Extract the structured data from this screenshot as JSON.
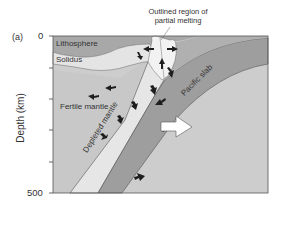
{
  "panel_label": "(a)",
  "callout": {
    "line1": "Outlined region of",
    "line2": "partial melting"
  },
  "axis": {
    "ylabel": "Depth (km)",
    "tick_top": "0",
    "tick_bottom": "500"
  },
  "regions": {
    "lithosphere": "Lithosphere",
    "solidus": "Solidus",
    "fertile_mantle": "Fertile mantle",
    "depleted_mantle": "Depleted mantle",
    "pacific_slab": "Pacific slab"
  },
  "colors": {
    "lithosphere": "#a8a8a8",
    "solidus_band": "#e4e4e4",
    "fertile_mantle": "#c9c9c9",
    "depleted_mantle": "#e6e6e6",
    "slab": "#9e9e9e",
    "deep_mantle": "#cdcdcd",
    "melt_region": "#f2f2f2",
    "frame": "#555555",
    "arrow": "#1e1e1e"
  }
}
